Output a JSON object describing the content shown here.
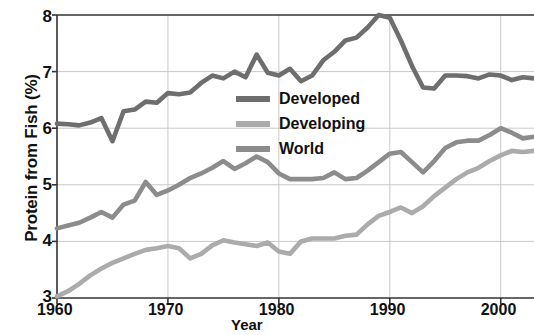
{
  "chart_data": {
    "type": "line",
    "title": "",
    "xlabel": "Year",
    "ylabel": "Protein from Fish (%)",
    "xlim": [
      1960,
      2003
    ],
    "ylim": [
      3,
      8
    ],
    "grid": true,
    "legend_position": "center",
    "xticks": [
      "1960",
      "1970",
      "1980",
      "1990",
      "2000"
    ],
    "xtick_values": [
      1960,
      1970,
      1980,
      1990,
      2000
    ],
    "yticks": [
      "3",
      "4",
      "5",
      "6",
      "7",
      "8"
    ],
    "ytick_values": [
      3,
      4,
      5,
      6,
      7,
      8
    ],
    "colors": {
      "developed": "#6e6e6e",
      "world": "#8c8c8c",
      "developing": "#ababab",
      "grid": "#c9c9c9",
      "axis": "#333333"
    },
    "x": [
      1960,
      1961,
      1962,
      1963,
      1964,
      1965,
      1966,
      1967,
      1968,
      1969,
      1970,
      1971,
      1972,
      1973,
      1974,
      1975,
      1976,
      1977,
      1978,
      1979,
      1980,
      1981,
      1982,
      1983,
      1984,
      1985,
      1986,
      1987,
      1988,
      1989,
      1990,
      1991,
      1992,
      1993,
      1994,
      1995,
      1996,
      1997,
      1998,
      1999,
      2000,
      2001,
      2002,
      2003
    ],
    "series": [
      {
        "name": "Developed",
        "color": "#6e6e6e",
        "values": [
          6.08,
          6.07,
          6.05,
          6.1,
          6.18,
          5.77,
          6.3,
          6.33,
          6.47,
          6.45,
          6.62,
          6.6,
          6.63,
          6.8,
          6.93,
          6.88,
          7.0,
          6.9,
          7.3,
          6.98,
          6.93,
          7.05,
          6.83,
          6.93,
          7.2,
          7.35,
          7.55,
          7.6,
          7.78,
          8.0,
          7.95,
          7.55,
          7.1,
          6.72,
          6.7,
          6.93,
          6.93,
          6.92,
          6.88,
          6.95,
          6.93,
          6.85,
          6.9,
          6.88
        ]
      },
      {
        "name": "Developing",
        "color": "#ababab",
        "values": [
          3.03,
          3.12,
          3.25,
          3.4,
          3.52,
          3.62,
          3.7,
          3.78,
          3.85,
          3.88,
          3.92,
          3.88,
          3.7,
          3.78,
          3.93,
          4.02,
          3.98,
          3.95,
          3.92,
          3.98,
          3.82,
          3.78,
          4.0,
          4.05,
          4.05,
          4.05,
          4.1,
          4.12,
          4.3,
          4.45,
          4.52,
          4.6,
          4.5,
          4.62,
          4.8,
          4.95,
          5.1,
          5.22,
          5.3,
          5.42,
          5.52,
          5.6,
          5.58,
          5.6
        ]
      },
      {
        "name": "World",
        "color": "#8c8c8c",
        "values": [
          4.23,
          4.28,
          4.33,
          4.42,
          4.52,
          4.42,
          4.65,
          4.72,
          5.05,
          4.82,
          4.9,
          5.0,
          5.12,
          5.2,
          5.3,
          5.42,
          5.28,
          5.38,
          5.5,
          5.4,
          5.2,
          5.1,
          5.1,
          5.1,
          5.12,
          5.22,
          5.1,
          5.12,
          5.25,
          5.4,
          5.55,
          5.58,
          5.4,
          5.22,
          5.42,
          5.65,
          5.75,
          5.78,
          5.78,
          5.88,
          6.0,
          5.92,
          5.82,
          5.85
        ]
      }
    ],
    "legend_entries": [
      {
        "label": "Developed",
        "color": "#6e6e6e"
      },
      {
        "label": "Developing",
        "color": "#ababab"
      },
      {
        "label": "World",
        "color": "#8c8c8c"
      }
    ]
  }
}
